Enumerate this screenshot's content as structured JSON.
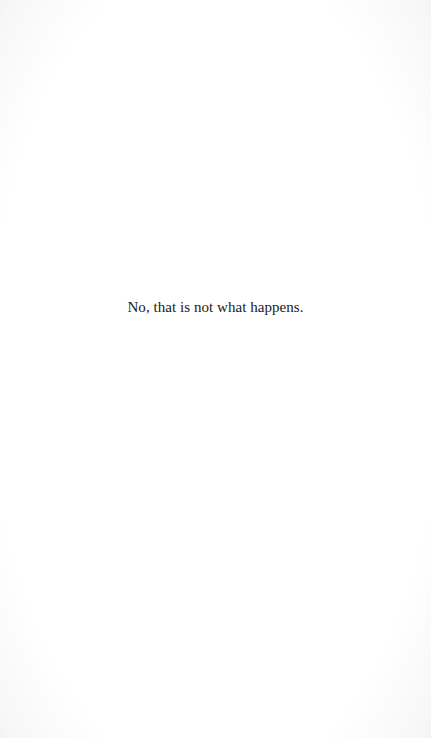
{
  "page": {
    "text": "No, that is not what happens."
  },
  "colors": {
    "paper": "#ffffff",
    "ink": "#1a1a1a",
    "edge_shadow": "#ececec"
  }
}
